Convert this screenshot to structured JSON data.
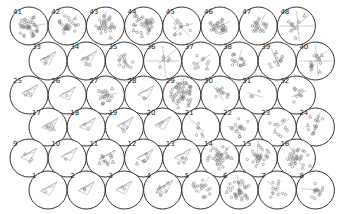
{
  "diagram": {
    "title": "",
    "radius": 19,
    "colors": {
      "circle_stroke": "#333333",
      "marker": "#777777",
      "edge": "#9a9a9a",
      "background": "#ffffff"
    },
    "rows": [
      {
        "y": 26,
        "x0": 29,
        "labels": [
          "41",
          "42",
          "43",
          "44",
          "45",
          "46",
          "47",
          "48"
        ]
      },
      {
        "y": 61,
        "x0": 48,
        "labels": [
          "33",
          "34",
          "35",
          "36",
          "37",
          "38",
          "39",
          "40"
        ]
      },
      {
        "y": 95,
        "x0": 29,
        "labels": [
          "25",
          "26",
          "27",
          "28",
          "29",
          "30",
          "31",
          "32"
        ]
      },
      {
        "y": 127,
        "x0": 48,
        "labels": [
          "17",
          "18",
          "19",
          "20",
          "21",
          "22",
          "23",
          "24"
        ]
      },
      {
        "y": 158,
        "x0": 29,
        "labels": [
          "9",
          "10",
          "11",
          "12",
          "13",
          "14",
          "15",
          "16"
        ]
      },
      {
        "y": 190,
        "x0": 48,
        "labels": [
          "1",
          "2",
          "3",
          "4",
          "5",
          "6",
          "7",
          "8"
        ]
      }
    ],
    "spacing": 38.2,
    "cells": {
      "41": {
        "style": "cluster",
        "n": 40,
        "tri": 0,
        "spread": 12
      },
      "42": {
        "style": "cluster",
        "n": 28,
        "tri": 0,
        "spread": 11
      },
      "43": {
        "style": "cluster",
        "n": 30,
        "tri": 2,
        "spread": 10
      },
      "44": {
        "style": "cluster",
        "n": 30,
        "tri": 6,
        "spread": 11
      },
      "45": {
        "style": "star",
        "n": 12,
        "tri": 0,
        "spread": 10
      },
      "46": {
        "style": "cluster",
        "n": 32,
        "tri": 0,
        "spread": 9
      },
      "47": {
        "style": "cluster",
        "n": 22,
        "tri": 0,
        "spread": 9
      },
      "48": {
        "style": "cross",
        "n": 4,
        "tri": 6,
        "spread": 10
      },
      "33": {
        "style": "kite",
        "n": 4,
        "tri": 0,
        "spread": 5
      },
      "34": {
        "style": "kite",
        "n": 4,
        "tri": 1,
        "spread": 6
      },
      "35": {
        "style": "cluster",
        "n": 14,
        "tri": 0,
        "spread": 8
      },
      "36": {
        "style": "cross",
        "n": 2,
        "tri": 3,
        "spread": 8
      },
      "37": {
        "style": "cluster",
        "n": 8,
        "tri": 2,
        "spread": 8
      },
      "38": {
        "style": "cluster",
        "n": 16,
        "tri": 0,
        "spread": 8
      },
      "39": {
        "style": "cluster",
        "n": 10,
        "tri": 3,
        "spread": 9
      },
      "40": {
        "style": "cross",
        "n": 10,
        "tri": 6,
        "spread": 10
      },
      "25": {
        "style": "kite",
        "n": 3,
        "tri": 0,
        "spread": 5
      },
      "26": {
        "style": "kite",
        "n": 1,
        "tri": 0,
        "spread": 4
      },
      "27": {
        "style": "cluster",
        "n": 16,
        "tri": 4,
        "spread": 9
      },
      "28": {
        "style": "kite",
        "n": 2,
        "tri": 0,
        "spread": 4
      },
      "29": {
        "style": "cluster",
        "n": 50,
        "tri": 6,
        "spread": 12
      },
      "30": {
        "style": "cluster",
        "n": 12,
        "tri": 0,
        "spread": 9
      },
      "31": {
        "style": "sparse",
        "n": 3,
        "tri": 0,
        "spread": 8
      },
      "32": {
        "style": "cluster",
        "n": 10,
        "tri": 0,
        "spread": 8
      },
      "17": {
        "style": "kite",
        "n": 4,
        "tri": 1,
        "spread": 5
      },
      "18": {
        "style": "kite",
        "n": 2,
        "tri": 0,
        "spread": 4
      },
      "19": {
        "style": "kite",
        "n": 4,
        "tri": 0,
        "spread": 6
      },
      "20": {
        "style": "kite",
        "n": 2,
        "tri": 0,
        "spread": 4
      },
      "21": {
        "style": "cluster",
        "n": 6,
        "tri": 0,
        "spread": 9
      },
      "22": {
        "style": "cluster",
        "n": 16,
        "tri": 0,
        "spread": 10
      },
      "23": {
        "style": "cluster",
        "n": 8,
        "tri": 2,
        "spread": 10
      },
      "24": {
        "style": "cluster",
        "n": 12,
        "tri": 3,
        "spread": 10
      },
      "9": {
        "style": "kite",
        "n": 3,
        "tri": 0,
        "spread": 5
      },
      "10": {
        "style": "kite",
        "n": 1,
        "tri": 0,
        "spread": 4
      },
      "11": {
        "style": "kite",
        "n": 8,
        "tri": 3,
        "spread": 6
      },
      "12": {
        "style": "kite",
        "n": 5,
        "tri": 1,
        "spread": 6
      },
      "13": {
        "style": "kite",
        "n": 5,
        "tri": 0,
        "spread": 6
      },
      "14": {
        "style": "cluster",
        "n": 36,
        "tri": 2,
        "spread": 12
      },
      "15": {
        "style": "cluster",
        "n": 28,
        "tri": 1,
        "spread": 12
      },
      "16": {
        "style": "cluster",
        "n": 30,
        "tri": 2,
        "spread": 11
      },
      "1": {
        "style": "kite",
        "n": 1,
        "tri": 0,
        "spread": 4
      },
      "2": {
        "style": "kite",
        "n": 2,
        "tri": 0,
        "spread": 4
      },
      "3": {
        "style": "kite",
        "n": 2,
        "tri": 0,
        "spread": 4
      },
      "4": {
        "style": "kite",
        "n": 6,
        "tri": 2,
        "spread": 8
      },
      "5": {
        "style": "cluster",
        "n": 18,
        "tri": 0,
        "spread": 10
      },
      "6": {
        "style": "cluster",
        "n": 36,
        "tri": 1,
        "spread": 12
      },
      "7": {
        "style": "cluster",
        "n": 12,
        "tri": 0,
        "spread": 10
      },
      "8": {
        "style": "cluster",
        "n": 14,
        "tri": 0,
        "spread": 9
      }
    }
  }
}
